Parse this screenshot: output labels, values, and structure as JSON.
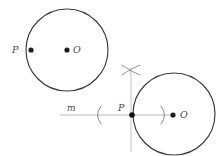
{
  "figure": {
    "background_color": "#ffffff",
    "stroke_color": "#3a3a3a",
    "construction_color": "#b4b4b4",
    "label_color": "#4a4a4a",
    "canvas": {
      "width": 221,
      "height": 156
    }
  },
  "top_figure": {
    "circle": {
      "name": "circle-O-top",
      "cx": 67,
      "cy": 50,
      "r": 41
    },
    "center_point": {
      "name": "center-point-O-top",
      "cx": 67,
      "cy": 50,
      "r": 2.6,
      "label": "O",
      "label_x": 73,
      "label_y": 45
    },
    "point_p": {
      "name": "point-P-top",
      "cx": 31,
      "cy": 50,
      "r": 2.6,
      "label": "P",
      "label_x": 12,
      "label_y": 45
    }
  },
  "bottom_figure": {
    "circle": {
      "name": "circle-O-bottom",
      "cx": 174,
      "cy": 114,
      "r": 41
    },
    "center_point": {
      "name": "center-point-O-bottom",
      "cx": 173,
      "cy": 115,
      "r": 2.6,
      "label": "O",
      "label_x": 180,
      "label_y": 110
    },
    "point_p": {
      "name": "point-P-bottom",
      "cx": 132,
      "cy": 115,
      "r": 2.8,
      "label": "P",
      "label_x": 118,
      "label_y": 103
    }
  },
  "line_m": {
    "name": "line-m",
    "label": "m",
    "label_x": 67,
    "label_y": 104,
    "x1": 60,
    "y1": 115,
    "x2": 172,
    "y2": 115
  },
  "construction": {
    "vertical_line": {
      "name": "perpendicular-construction-line",
      "x1": 131,
      "y1": 68,
      "x2": 131,
      "y2": 152
    },
    "arc_intersection_mark": {
      "name": "arc-intersection-x-mark",
      "cx": 131,
      "cy": 70,
      "size": 9
    },
    "compass_arc_left": {
      "name": "compass-arc-left",
      "symbol": "(",
      "cx": 97,
      "cy": 115,
      "r": 9
    },
    "compass_arc_right": {
      "name": "compass-arc-right",
      "symbol": ")",
      "cx": 165,
      "cy": 115,
      "r": 9
    }
  }
}
